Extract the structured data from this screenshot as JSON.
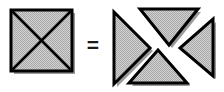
{
  "figure": {
    "equals_symbol": "=",
    "background_color": "#ffffff",
    "fill_color": "#c8c8c8",
    "stipple_color": "#8c8c8c",
    "outline_color": "#000000",
    "shadow_color": "#9a9a9a",
    "canvas": {
      "width": 224,
      "height": 92
    }
  },
  "left_shape": {
    "name": "square-with-diagonals",
    "kind": "square",
    "label": "square",
    "x": 11,
    "y": 10,
    "width": 61,
    "height": 61,
    "diagonals": 2,
    "diagonal_description": "both diagonals drawn forming an X",
    "outline_width": 3,
    "shadow_offset": 3
  },
  "right_shape": {
    "name": "four-triangle-dissection",
    "kind": "triangle-group",
    "label": "four triangles",
    "piece_count": 4,
    "pieces": [
      {
        "name": "triangle-left",
        "label": "left triangle",
        "points_toward": "right",
        "points": "114,12 114,84 150,48"
      },
      {
        "name": "triangle-top",
        "label": "top triangle",
        "points_toward": "down",
        "points": "140,9 198,9 169,45"
      },
      {
        "name": "triangle-right",
        "label": "right triangle",
        "points_toward": "left",
        "points": "213,19 213,76 180,48"
      },
      {
        "name": "triangle-bottom",
        "label": "bottom triangle",
        "points_toward": "up",
        "points": "129,83 187,83 158,50"
      }
    ]
  }
}
